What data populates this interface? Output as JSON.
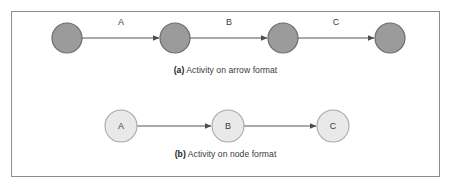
{
  "figure": {
    "frame_color": "#8d8d8d",
    "background": "#ffffff"
  },
  "diagram_a": {
    "caption_tag": "(a)",
    "caption_text": "Activity on arrow format",
    "node_fill": "#9b9b9b",
    "node_stroke": "#6b6b6b",
    "arrow_color": "#555555",
    "events": [
      {
        "id": "event-1",
        "cx": 67,
        "cy": 38,
        "r": 15
      },
      {
        "id": "event-2",
        "cx": 175,
        "cy": 38,
        "r": 15
      },
      {
        "id": "event-3",
        "cx": 283,
        "cy": 38,
        "r": 15
      },
      {
        "id": "event-4",
        "cx": 390,
        "cy": 38,
        "r": 15
      }
    ],
    "activities": [
      {
        "label": "A",
        "from": "event-1",
        "to": "event-2",
        "x1": 82,
        "x2": 159,
        "y": 38,
        "label_x": 121,
        "label_y": 23
      },
      {
        "label": "B",
        "from": "event-2",
        "to": "event-3",
        "x1": 190,
        "x2": 267,
        "y": 38,
        "label_x": 229,
        "label_y": 23
      },
      {
        "label": "C",
        "from": "event-3",
        "to": "event-4",
        "x1": 298,
        "x2": 374,
        "y": 38,
        "label_x": 336,
        "label_y": 23
      }
    ]
  },
  "diagram_b": {
    "caption_tag": "(b)",
    "caption_text": "Activity on node format",
    "node_fill": "#e9e9e9",
    "node_stroke": "#a8a8a8",
    "arrow_color": "#555555",
    "nodes": [
      {
        "label": "A",
        "cx": 121,
        "cy": 126,
        "r": 16
      },
      {
        "label": "B",
        "cx": 228,
        "cy": 126,
        "r": 16
      },
      {
        "label": "C",
        "cx": 333,
        "cy": 126,
        "r": 16
      }
    ],
    "links": [
      {
        "from": "A",
        "to": "B",
        "x1": 137,
        "x2": 211,
        "y": 126
      },
      {
        "from": "B",
        "to": "C",
        "x1": 244,
        "x2": 316,
        "y": 126
      }
    ]
  }
}
